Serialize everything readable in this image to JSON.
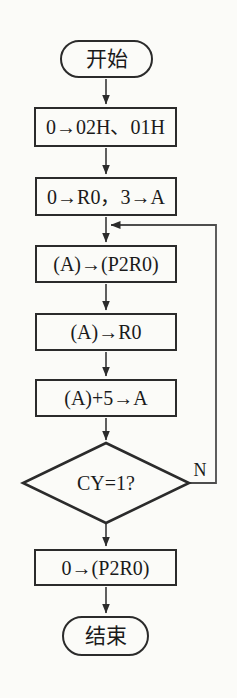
{
  "flowchart": {
    "nodes": [
      {
        "id": "start",
        "shape": "terminal",
        "label": "开始"
      },
      {
        "id": "init-mem",
        "shape": "process",
        "label": "0→02H、01H"
      },
      {
        "id": "init-reg",
        "shape": "process",
        "label": "0→R0，3→A"
      },
      {
        "id": "store",
        "shape": "process",
        "label": "(A)→(P2R0)"
      },
      {
        "id": "move",
        "shape": "process",
        "label": "(A)→R0"
      },
      {
        "id": "add",
        "shape": "process",
        "label": "(A)+5→A"
      },
      {
        "id": "decision",
        "shape": "decision",
        "label": "CY=1?"
      },
      {
        "id": "clear",
        "shape": "process",
        "label": "0→(P2R0)"
      },
      {
        "id": "end",
        "shape": "terminal",
        "label": "结束"
      }
    ],
    "edges": [
      {
        "from": "start",
        "to": "init-mem"
      },
      {
        "from": "init-mem",
        "to": "init-reg"
      },
      {
        "from": "init-reg",
        "to": "store"
      },
      {
        "from": "store",
        "to": "move"
      },
      {
        "from": "move",
        "to": "add"
      },
      {
        "from": "add",
        "to": "decision"
      },
      {
        "from": "decision",
        "to": "clear"
      },
      {
        "from": "clear",
        "to": "end"
      },
      {
        "from": "decision",
        "to": "store",
        "label": "N"
      }
    ],
    "colors": {
      "stroke": "#2b2b2b",
      "connector": "#4d4d4d",
      "text": "#1a1a1a",
      "background": "#fbfbf8"
    }
  }
}
